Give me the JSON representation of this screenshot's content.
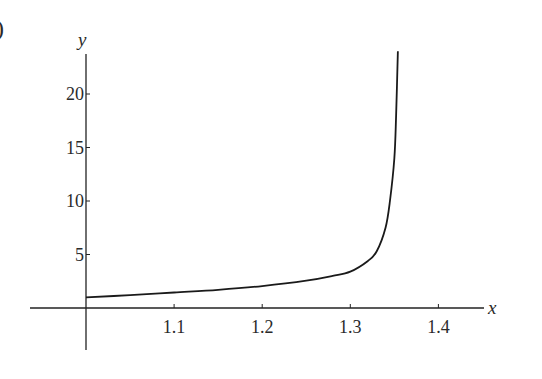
{
  "panel_label": ")",
  "chart_data": {
    "type": "line",
    "title": "",
    "xlabel": "x",
    "ylabel": "y",
    "xlim": [
      0.999,
      1.46
    ],
    "ylim": [
      -4,
      24
    ],
    "x_ticks": [
      1.1,
      1.2,
      1.3,
      1.4
    ],
    "x_tick_labels": [
      "1.1",
      "1.2",
      "1.3",
      "1.4"
    ],
    "y_ticks": [
      5,
      10,
      15,
      20
    ],
    "y_tick_labels": [
      "5",
      "10",
      "15",
      "20"
    ],
    "grid": false,
    "legend": null,
    "series": [
      {
        "name": "y(x)",
        "color": "#1a1a1a",
        "x": [
          1.0,
          1.05,
          1.1,
          1.15,
          1.2,
          1.25,
          1.28,
          1.3,
          1.32,
          1.33,
          1.34,
          1.345,
          1.35,
          1.352,
          1.354
        ],
        "values": [
          1.0,
          1.2,
          1.45,
          1.7,
          2.05,
          2.55,
          3.0,
          3.4,
          4.4,
          5.3,
          7.5,
          10.0,
          14.0,
          18.0,
          24.0
        ]
      }
    ],
    "annotations": [
      "vertical asymptote near x ≈ 1.355"
    ]
  }
}
